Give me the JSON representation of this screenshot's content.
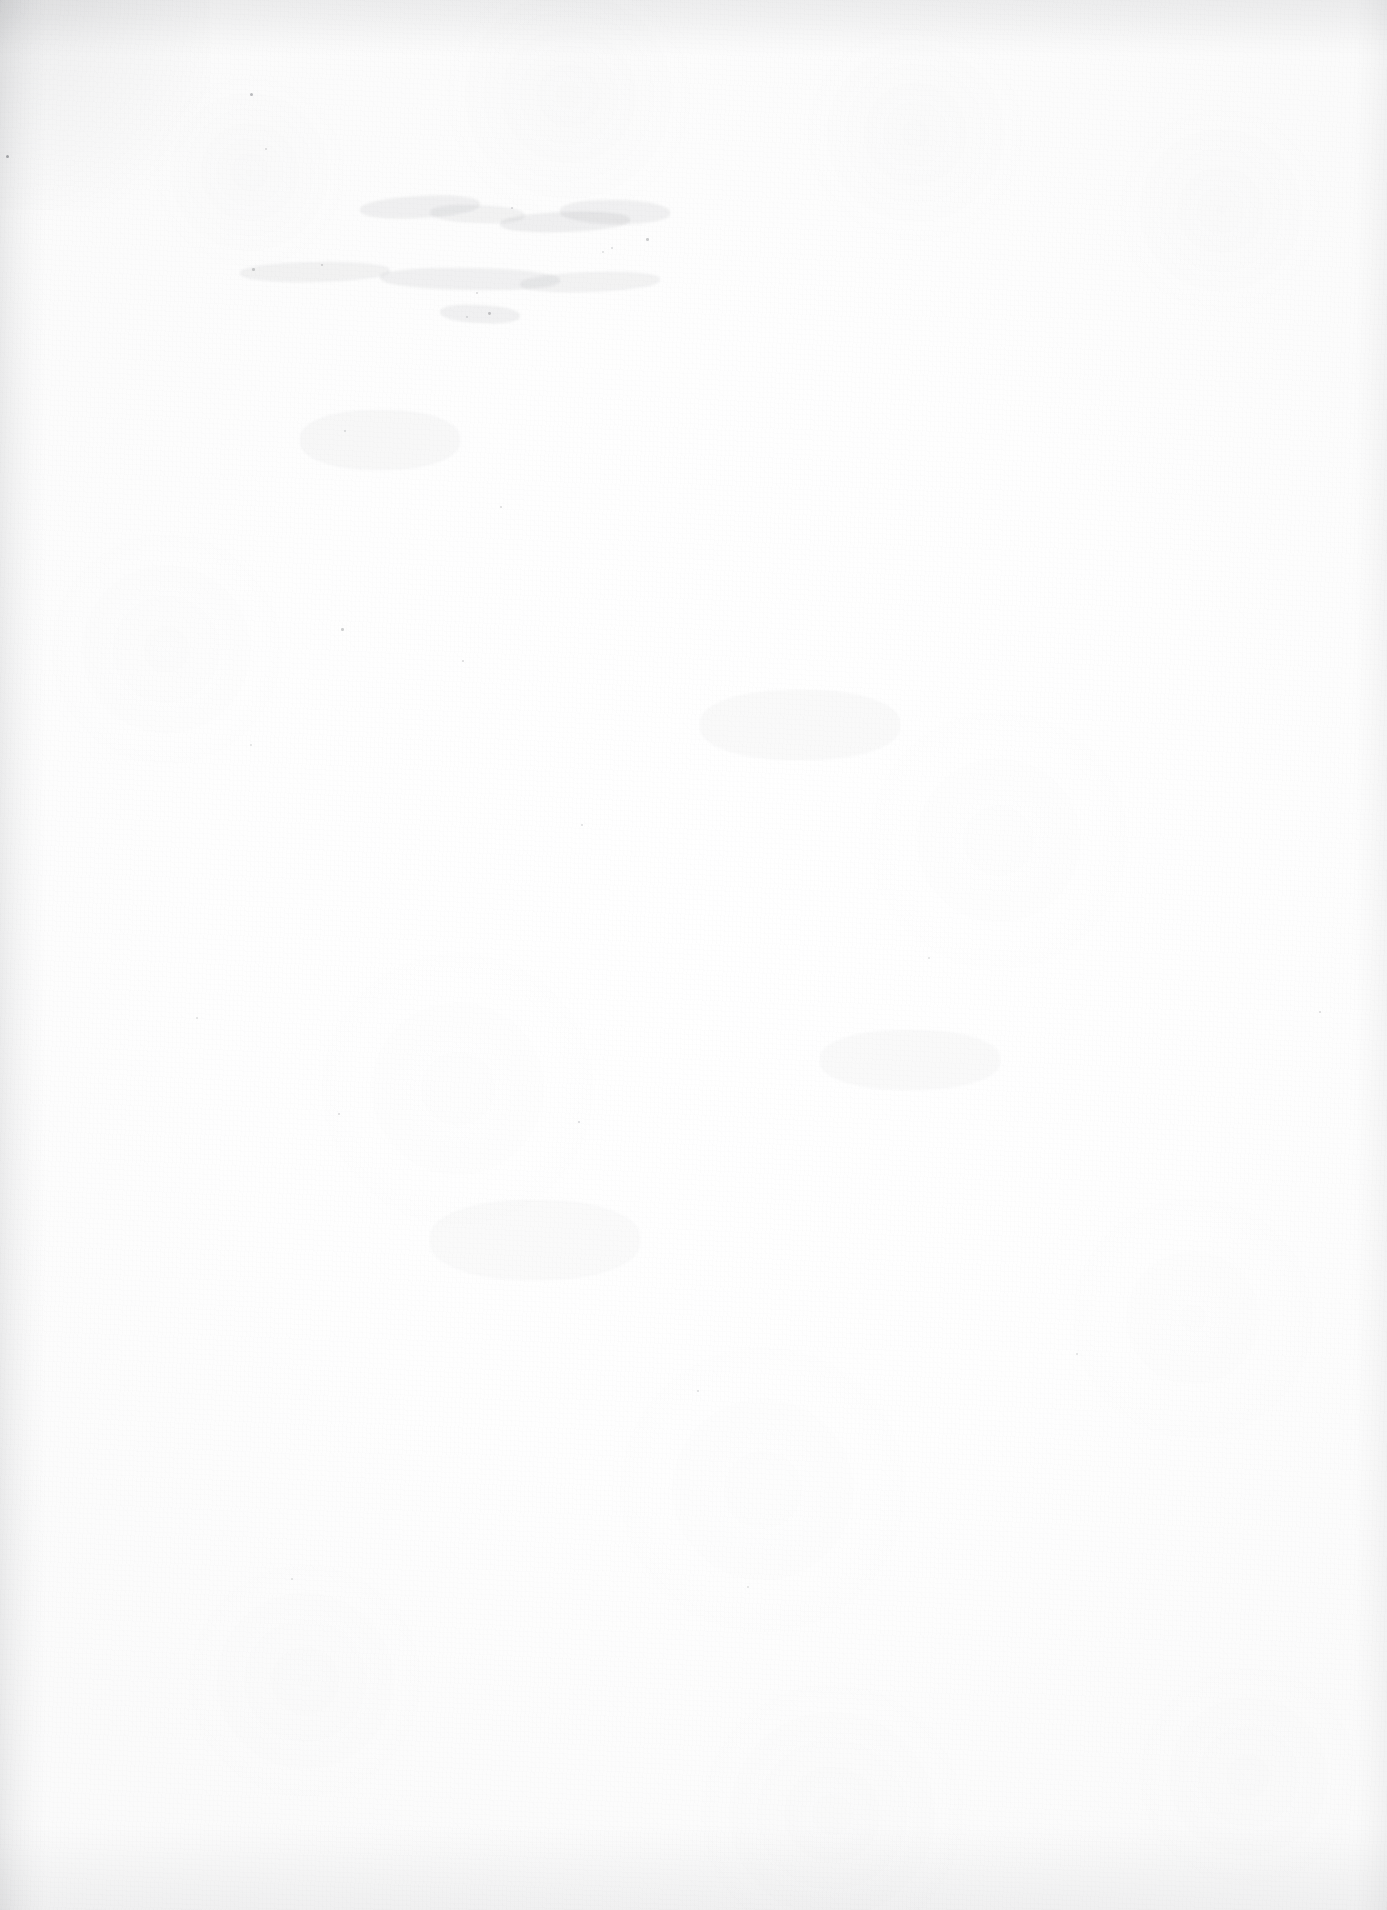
{
  "document": {
    "page_kind": "blank-scanned-page",
    "visible_text": "",
    "text_lines": [],
    "headings": [],
    "page_number": "",
    "caption": "",
    "notes": ""
  },
  "canvas": {
    "width": 1387,
    "height": 1910
  },
  "appearance": {
    "paper_color": "#fdfdfd",
    "base_white": "#ffffff",
    "texture_tone": "#f7f7f8",
    "edge_shadow_color": "#787a80",
    "speck_color": "#606268",
    "smudge_color": "#82848a"
  },
  "edges": {
    "top_shadow_height_px": 56,
    "bottom_shadow_height_px": 86,
    "left_shadow_width_px": 46,
    "right_shadow_width_px": 34
  },
  "marks": {
    "description": "scattered faint specks and residual ghost marks, none legible",
    "specks": [
      {
        "x": 250,
        "y": 93,
        "size": 3.0,
        "opacity": 0.42
      },
      {
        "x": 6,
        "y": 155,
        "size": 3.4,
        "opacity": 0.5
      },
      {
        "x": 265,
        "y": 148,
        "size": 2.2,
        "opacity": 0.24
      },
      {
        "x": 511,
        "y": 207,
        "size": 2.0,
        "opacity": 0.26
      },
      {
        "x": 646,
        "y": 238,
        "size": 2.6,
        "opacity": 0.32
      },
      {
        "x": 611,
        "y": 247,
        "size": 2.0,
        "opacity": 0.22
      },
      {
        "x": 602,
        "y": 251,
        "size": 1.8,
        "opacity": 0.2
      },
      {
        "x": 321,
        "y": 264,
        "size": 2.4,
        "opacity": 0.28
      },
      {
        "x": 252,
        "y": 268,
        "size": 2.6,
        "opacity": 0.3
      },
      {
        "x": 476,
        "y": 292,
        "size": 2.2,
        "opacity": 0.24
      },
      {
        "x": 488,
        "y": 312,
        "size": 2.8,
        "opacity": 0.34
      },
      {
        "x": 466,
        "y": 316,
        "size": 2.0,
        "opacity": 0.22
      },
      {
        "x": 344,
        "y": 430,
        "size": 2.2,
        "opacity": 0.22
      },
      {
        "x": 500,
        "y": 506,
        "size": 2.2,
        "opacity": 0.24
      },
      {
        "x": 341,
        "y": 628,
        "size": 2.6,
        "opacity": 0.3
      },
      {
        "x": 462,
        "y": 660,
        "size": 2.2,
        "opacity": 0.24
      },
      {
        "x": 250,
        "y": 744,
        "size": 2.0,
        "opacity": 0.2
      },
      {
        "x": 581,
        "y": 824,
        "size": 2.0,
        "opacity": 0.22
      },
      {
        "x": 578,
        "y": 1121,
        "size": 2.4,
        "opacity": 0.26
      },
      {
        "x": 338,
        "y": 1113,
        "size": 2.2,
        "opacity": 0.24
      },
      {
        "x": 196,
        "y": 1017,
        "size": 2.0,
        "opacity": 0.2
      },
      {
        "x": 697,
        "y": 1390,
        "size": 2.2,
        "opacity": 0.22
      },
      {
        "x": 291,
        "y": 1578,
        "size": 2.0,
        "opacity": 0.2
      },
      {
        "x": 1319,
        "y": 1011,
        "size": 2.2,
        "opacity": 0.24
      },
      {
        "x": 928,
        "y": 957,
        "size": 2.0,
        "opacity": 0.2
      },
      {
        "x": 747,
        "y": 1586,
        "size": 2.0,
        "opacity": 0.2
      },
      {
        "x": 1076,
        "y": 1353,
        "size": 2.0,
        "opacity": 0.2
      }
    ],
    "smudges": [
      {
        "x": 360,
        "y": 196,
        "w": 120,
        "h": 22,
        "rot": -3,
        "opacity": 0.1
      },
      {
        "x": 430,
        "y": 205,
        "w": 95,
        "h": 18,
        "rot": 2,
        "opacity": 0.09
      },
      {
        "x": 500,
        "y": 212,
        "w": 130,
        "h": 20,
        "rot": -2,
        "opacity": 0.11
      },
      {
        "x": 560,
        "y": 200,
        "w": 110,
        "h": 24,
        "rot": 1,
        "opacity": 0.1
      },
      {
        "x": 240,
        "y": 262,
        "w": 150,
        "h": 20,
        "rot": -1,
        "opacity": 0.09
      },
      {
        "x": 380,
        "y": 268,
        "w": 180,
        "h": 22,
        "rot": 1,
        "opacity": 0.1
      },
      {
        "x": 520,
        "y": 272,
        "w": 140,
        "h": 20,
        "rot": -2,
        "opacity": 0.09
      },
      {
        "x": 440,
        "y": 305,
        "w": 80,
        "h": 18,
        "rot": 3,
        "opacity": 0.1
      },
      {
        "x": 300,
        "y": 410,
        "w": 160,
        "h": 60,
        "rot": 0,
        "opacity": 0.05
      },
      {
        "x": 700,
        "y": 690,
        "w": 200,
        "h": 70,
        "rot": 0,
        "opacity": 0.04
      },
      {
        "x": 820,
        "y": 1030,
        "w": 180,
        "h": 60,
        "rot": 0,
        "opacity": 0.04
      },
      {
        "x": 430,
        "y": 1200,
        "w": 210,
        "h": 80,
        "rot": 0,
        "opacity": 0.035
      }
    ]
  }
}
